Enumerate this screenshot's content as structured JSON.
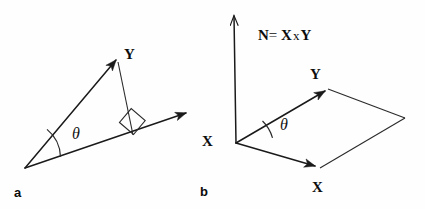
{
  "figure": {
    "background_color": "#fefefe",
    "stroke_color": "#1a1a1a",
    "text_color": "#0d0d0d"
  },
  "panel_a": {
    "letter": "a",
    "vector_y_label": "Y",
    "angle_label": "θ",
    "right_angle_marker": "right-angle-square",
    "description_items": {
      "base_vector": "unlabeled horizontal base arrow",
      "hypotenuse_vector": "Y arrow from origin",
      "perpendicular_drop": "perpendicular from Y tip to base"
    }
  },
  "panel_b": {
    "letter": "b",
    "normal_label": {
      "symbol_n": "N",
      "equals": "=",
      "symbol_x": "X",
      "cross": "x",
      "symbol_y": "Y",
      "full_text": "N = X x Y"
    },
    "vector_y_label": "Y",
    "vector_x_label_left": "X",
    "vector_x_label_bottom": "X",
    "angle_label": "θ",
    "shape": "parallelogram spanned by X and Y"
  }
}
